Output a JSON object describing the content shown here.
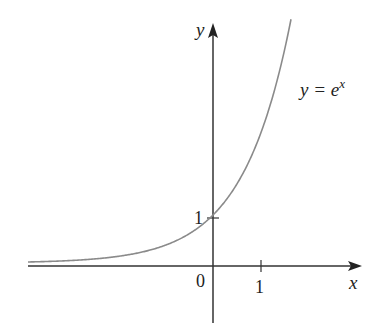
{
  "figure": {
    "function_label": "y = e",
    "function_label_exp": "x",
    "axis_x_label": "x",
    "axis_y_label": "y",
    "origin_label": "0",
    "x_tick_label": "1",
    "y_tick_label": "1",
    "curve_color": "#8a8a8a",
    "axis_color": "#333333"
  }
}
